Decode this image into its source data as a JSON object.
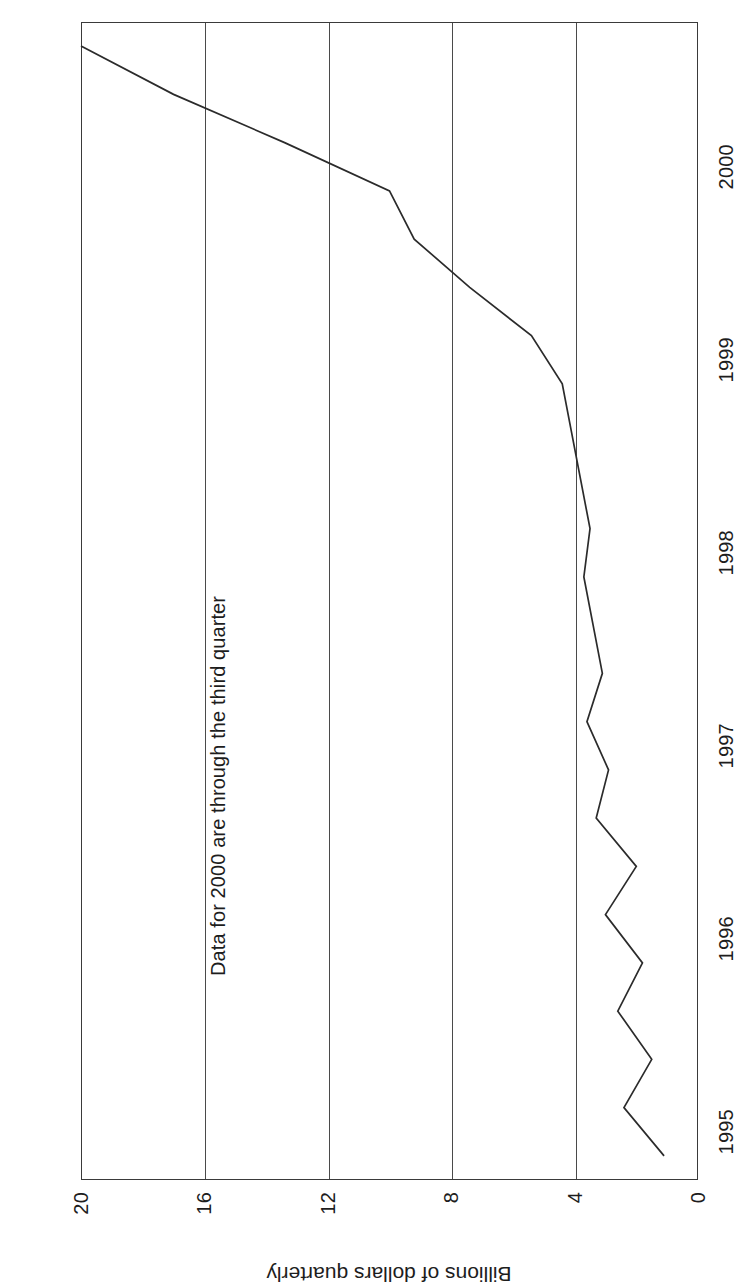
{
  "chart_data": {
    "type": "line",
    "title": "",
    "subtitle": "",
    "xlabel": "",
    "ylabel": "Billions of dollars quarterly",
    "annotation": "Data for 2000 are through the third quarter",
    "grid": "horizontal",
    "legend": "none",
    "xlim": [
      1994.75,
      2000.75
    ],
    "ylim": [
      0,
      20
    ],
    "xticks": [
      "1995",
      "1996",
      "1997",
      "1998",
      "1999",
      "2000"
    ],
    "xtick_values": [
      1995,
      1996,
      1997,
      1998,
      1999,
      2000
    ],
    "yticks": [
      "0",
      "4",
      "8",
      "12",
      "16",
      "20"
    ],
    "ytick_values": [
      0,
      4,
      8,
      12,
      16,
      20
    ],
    "series": [
      {
        "name": "Quarterly value",
        "color": "#2b2b2b",
        "x": [
          1994.875,
          1995.125,
          1995.375,
          1995.625,
          1995.875,
          1996.125,
          1996.375,
          1996.625,
          1996.875,
          1997.125,
          1997.375,
          1997.625,
          1997.875,
          1998.125,
          1998.375,
          1998.625,
          1998.875,
          1999.125,
          1999.375,
          1999.625,
          1999.875,
          2000.125,
          2000.375,
          2000.625
        ],
        "values": [
          1.1,
          2.4,
          1.5,
          2.6,
          1.8,
          3.0,
          2.0,
          3.3,
          2.9,
          3.6,
          3.1,
          3.4,
          3.7,
          3.5,
          3.8,
          4.1,
          4.4,
          5.4,
          7.4,
          9.2,
          10.0,
          13.4,
          17.0,
          20.0
        ]
      }
    ]
  },
  "axis": {
    "y_title": "Billions of dollars quarterly"
  }
}
